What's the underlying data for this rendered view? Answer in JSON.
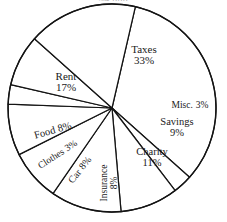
{
  "figure": {
    "clipped_title": "$4,000",
    "background_color": "#ffffff",
    "line_color": "#141414",
    "text_color": "#1a1a1a"
  },
  "chart_data": {
    "type": "pie",
    "title": "$4,000",
    "xlabel": "",
    "ylabel": "",
    "legend_position": "none",
    "labels_inside_slices": true,
    "grid": false,
    "total": 100,
    "units": "%",
    "categories": [
      "Taxes",
      "Misc.",
      "Savings",
      "Charity",
      "Insurance",
      "Car",
      "Clothes",
      "Food",
      "Rent"
    ],
    "values": [
      33,
      3,
      9,
      11,
      8,
      8,
      3,
      8,
      17
    ],
    "slices": [
      {
        "name": "Taxes",
        "value": 33,
        "label": "Taxes",
        "percent_label": "33%",
        "start_deg": -77,
        "end_deg": 41.8,
        "label_x": 144,
        "label_y": 55,
        "label_rotation": 0,
        "label_size": 11,
        "label_layout": "stacked"
      },
      {
        "name": "Misc.",
        "value": 3,
        "label": "Misc.",
        "percent_label": "3%",
        "start_deg": 41.8,
        "end_deg": 52.6,
        "label_x": 190,
        "label_y": 106,
        "label_rotation": 0,
        "label_size": 9.5,
        "label_layout": "inline"
      },
      {
        "name": "Savings",
        "value": 9,
        "label": "Savings",
        "percent_label": "9%",
        "start_deg": 52.6,
        "end_deg": 85,
        "label_x": 177,
        "label_y": 128,
        "label_rotation": 0,
        "label_size": 10.5,
        "label_layout": "stacked"
      },
      {
        "name": "Charity",
        "value": 11,
        "label": "Charity",
        "percent_label": "11%",
        "start_deg": 85,
        "end_deg": 124.6,
        "label_x": 152,
        "label_y": 158,
        "label_rotation": 0,
        "label_size": 10.5,
        "label_layout": "stacked"
      },
      {
        "name": "Insurance",
        "value": 8,
        "label": "Insurance",
        "percent_label": "8%",
        "start_deg": 124.6,
        "end_deg": 153.4,
        "label_x": 110,
        "label_y": 183,
        "label_rotation": -90,
        "label_size": 9.5,
        "label_layout": "stacked"
      },
      {
        "name": "Car",
        "value": 8,
        "label": "Car",
        "percent_label": "8%",
        "start_deg": 153.4,
        "end_deg": 182.2,
        "label_x": 80,
        "label_y": 170,
        "label_rotation": -52,
        "label_size": 10,
        "label_layout": "inline"
      },
      {
        "name": "Clothes",
        "value": 3,
        "label": "Clothes",
        "percent_label": "3%",
        "start_deg": 182.2,
        "end_deg": 193,
        "label_x": 58,
        "label_y": 155,
        "label_rotation": -33,
        "label_size": 9.5,
        "label_layout": "inline"
      },
      {
        "name": "Food",
        "value": 8,
        "label": "Food",
        "percent_label": "8%",
        "start_deg": 193,
        "end_deg": 221.8,
        "label_x": 53,
        "label_y": 131,
        "label_rotation": -16,
        "label_size": 10.5,
        "label_layout": "inline"
      },
      {
        "name": "Rent",
        "value": 17,
        "label": "Rent",
        "percent_label": "17%",
        "start_deg": 221.8,
        "end_deg": 283,
        "label_x": 66,
        "label_y": 82,
        "label_rotation": 0,
        "label_size": 11,
        "label_layout": "stacked"
      }
    ],
    "geometry": {
      "center_x": 112,
      "center_y": 108,
      "radius": 104
    }
  }
}
